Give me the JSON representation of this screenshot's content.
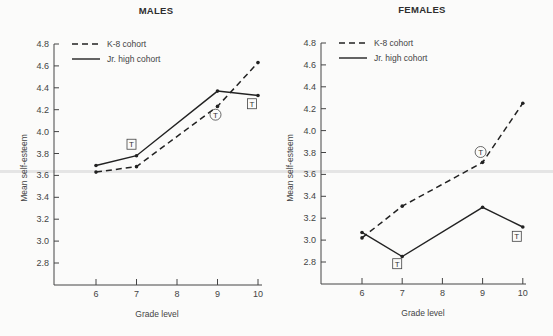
{
  "chart_data": [
    {
      "type": "line",
      "title": "MALES",
      "xlabel": "Grade level",
      "ylabel": "Mean self-esteem",
      "x": [
        6,
        7,
        9,
        10
      ],
      "x_ticks": [
        6,
        7,
        8,
        9,
        10
      ],
      "y_ticks": [
        "2.8",
        "3.0",
        "3.2",
        "3.4",
        "3.6",
        "3.8",
        "4.0",
        "4.2",
        "4.4",
        "4.6",
        "4.8"
      ],
      "ylim": [
        2.6,
        4.8
      ],
      "grid": false,
      "legend_position": "top-left",
      "series": [
        {
          "name": "K-8 cohort",
          "style": "dashed",
          "values": [
            3.63,
            3.68,
            4.23,
            4.63
          ]
        },
        {
          "name": "Jr. high cohort",
          "style": "solid",
          "values": [
            3.69,
            3.78,
            4.37,
            4.33
          ]
        }
      ],
      "annotations": [
        {
          "text": "T",
          "shape": "box",
          "x": 7,
          "y": 3.88
        },
        {
          "text": "T",
          "shape": "circle",
          "x": 9,
          "y": 4.15
        },
        {
          "text": "T",
          "shape": "box",
          "x": 10,
          "y": 4.25
        }
      ]
    },
    {
      "type": "line",
      "title": "FEMALES",
      "xlabel": "Grade level",
      "ylabel": "Mean self-esteem",
      "x": [
        6,
        7,
        9,
        10
      ],
      "x_ticks": [
        6,
        7,
        8,
        9,
        10
      ],
      "y_ticks": [
        "2.8",
        "3.0",
        "3.2",
        "3.4",
        "3.6",
        "3.8",
        "4.0",
        "4.2",
        "4.4",
        "4.6",
        "4.8"
      ],
      "ylim": [
        2.6,
        4.8
      ],
      "grid": false,
      "legend_position": "top-left",
      "series": [
        {
          "name": "K-8 cohort",
          "style": "dashed",
          "values": [
            3.02,
            3.31,
            3.71,
            4.25
          ]
        },
        {
          "name": "Jr. high cohort",
          "style": "solid",
          "values": [
            3.07,
            2.85,
            3.3,
            3.12
          ]
        }
      ],
      "annotations": [
        {
          "text": "T",
          "shape": "circle",
          "x": 9,
          "y": 3.8
        },
        {
          "text": "T",
          "shape": "box",
          "x": 7,
          "y": 2.78
        },
        {
          "text": "T",
          "shape": "box",
          "x": 10,
          "y": 3.03
        }
      ]
    }
  ],
  "labels": {
    "males_title": "MALES",
    "females_title": "FEMALES",
    "xlabel": "Grade level",
    "ylabel": "Mean self-esteem",
    "legend_k8": "K-8 cohort",
    "legend_jr": "Jr. high cohort",
    "marker": "T"
  }
}
